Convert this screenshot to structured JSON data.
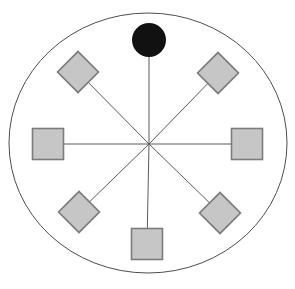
{
  "diagram": {
    "type": "star-network-figure",
    "canvas": {
      "width": 295,
      "height": 289,
      "background": "#ffffff"
    },
    "outer_circle": {
      "cx": 148,
      "cy": 143,
      "rx": 139,
      "ry": 130,
      "stroke": "#4d4d4d",
      "stroke_width": 1
    },
    "hub": {
      "x": 149,
      "y": 144
    },
    "colors": {
      "node_fill": "#c6c6c6",
      "node_border": "#7c7c7c",
      "line": "#5a5a5a",
      "filled_node": "#111111"
    },
    "spoke_count": 8,
    "nodes": [
      {
        "id": "top-circle",
        "shape": "circle",
        "cx": 149,
        "cy": 40,
        "r": 17
      },
      {
        "id": "upper-left-diamond",
        "shape": "diamond",
        "cx": 78,
        "cy": 72,
        "size": 29
      },
      {
        "id": "upper-right-diamond",
        "shape": "diamond",
        "cx": 218,
        "cy": 73,
        "size": 29
      },
      {
        "id": "left-square",
        "shape": "square",
        "cx": 48,
        "cy": 144,
        "size": 31
      },
      {
        "id": "right-square",
        "shape": "square",
        "cx": 247,
        "cy": 144,
        "size": 31
      },
      {
        "id": "lower-left-diamond",
        "shape": "diamond",
        "cx": 79,
        "cy": 212,
        "size": 29
      },
      {
        "id": "lower-right-diamond",
        "shape": "diamond",
        "cx": 220,
        "cy": 213,
        "size": 29
      },
      {
        "id": "bottom-square",
        "shape": "square",
        "cx": 147,
        "cy": 244,
        "size": 31
      }
    ]
  }
}
